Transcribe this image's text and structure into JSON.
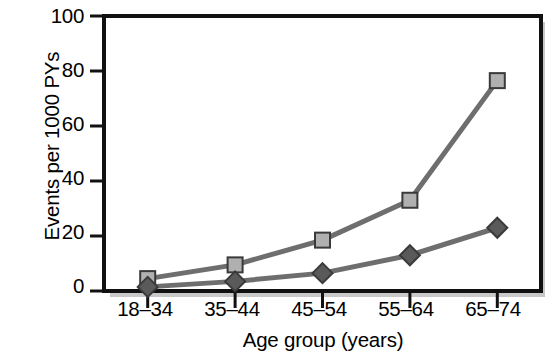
{
  "chart_data": {
    "type": "line",
    "title": "",
    "xlabel": "Age group (years)",
    "ylabel": "Events per 1000 PYs",
    "categories": [
      "18–34",
      "35–44",
      "45–54",
      "55–64",
      "65–74"
    ],
    "ylim": [
      0,
      100
    ],
    "yticks": [
      0,
      20,
      40,
      60,
      80,
      100
    ],
    "ytick_labels": [
      "0",
      "20",
      "40",
      "60",
      "80",
      "100"
    ],
    "grid": false,
    "legend": "none",
    "series": [
      {
        "name": "series-square",
        "marker": "square",
        "marker_fill": "#b0b0b0",
        "marker_stroke": "#3a3a3a",
        "line_color": "#6e6e6e",
        "values": [
          4.5,
          9.5,
          18.5,
          33,
          76.5
        ]
      },
      {
        "name": "series-diamond",
        "marker": "diamond",
        "marker_fill": "#5a5a5a",
        "marker_stroke": "#3a3a3a",
        "line_color": "#6e6e6e",
        "values": [
          1.5,
          3.5,
          6.5,
          13,
          23
        ]
      }
    ],
    "colors": {
      "axis": "#111111",
      "frame_shadow": "#c8c8c8",
      "plot_background": "#ffffff",
      "text": "#000000"
    }
  }
}
